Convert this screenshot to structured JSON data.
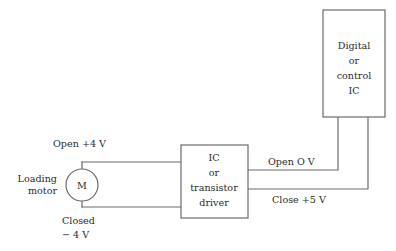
{
  "diagram": {
    "colors": {
      "line": "#6b6b6b",
      "text": "#2b2b2b",
      "background": "#ffffff"
    },
    "blocks": {
      "digital_ic": {
        "lines": [
          "Digital",
          "or",
          "control",
          "IC"
        ],
        "line1": "Digital",
        "line2": "or",
        "line3": "control",
        "line4": "IC"
      },
      "driver_ic": {
        "lines": [
          "IC",
          "or",
          "transistor",
          "driver"
        ],
        "line1": "IC",
        "line2": "or",
        "line3": "transistor",
        "line4": "driver"
      },
      "motor": {
        "symbol": "M",
        "label_line1": "Loading",
        "label_line2": "motor"
      }
    },
    "signal_labels": {
      "motor_open": "Open +4 V",
      "motor_closed_line1": "Closed",
      "motor_closed_line2": "− 4 V",
      "ic_open": "Open  O V",
      "ic_close": "Close +5 V"
    }
  }
}
